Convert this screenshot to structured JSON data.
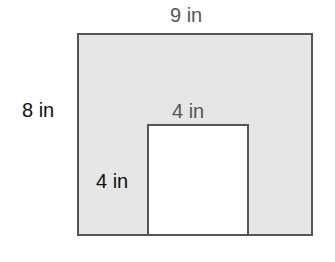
{
  "diagram": {
    "type": "composite-rectangle-area",
    "outer_rectangle": {
      "width_label": "9 in",
      "height_label": "8 in",
      "fill": "#e6e6e6"
    },
    "cutout_rectangle": {
      "width_label": "4 in",
      "height_label": "4 in",
      "fill": "#ffffff",
      "position": "bottom-center"
    },
    "stroke_color": "#555555"
  }
}
